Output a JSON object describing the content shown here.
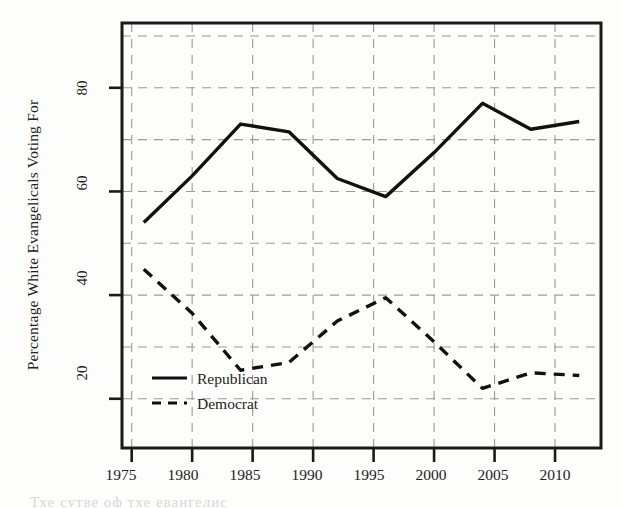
{
  "figure": {
    "background_color": "#fdfdfc",
    "axis_color": "#1a1a1a",
    "grid_color": "#9a9a9a",
    "series_colors": {
      "republican": "#111111",
      "democrat": "#111111"
    },
    "bottom_artifact_text": "Тхе сутве оф тхе евангелис"
  },
  "chart_data": {
    "type": "line",
    "title": "",
    "xlabel": "",
    "ylabel": "Percentage White Evangelicals Voting For",
    "xlim": [
      1974.2,
      2013.8
    ],
    "ylim": [
      10.5,
      92.5
    ],
    "xticks": [
      1975,
      1980,
      1985,
      1990,
      1995,
      2000,
      2005,
      2010
    ],
    "xtick_labels": [
      "1975",
      "1980",
      "1985",
      "1990",
      "1995",
      "2000",
      "2005",
      "2010"
    ],
    "yticks": [
      20,
      40,
      60,
      80
    ],
    "ytick_labels": [
      "20",
      "40",
      "60",
      "80"
    ],
    "y_gridlines": [
      20,
      30,
      40,
      50,
      60,
      70,
      80,
      90
    ],
    "x_gridlines": [
      1975,
      1980,
      1985,
      1990,
      1995,
      2000,
      2005,
      2010
    ],
    "grid": true,
    "legend_position": "lower left",
    "x": [
      1976,
      1980,
      1984,
      1988,
      1992,
      1996,
      2000,
      2004,
      2008,
      2012
    ],
    "series": [
      {
        "name": "Republican",
        "style": "solid",
        "values": [
          54,
          63,
          73,
          71.5,
          62.5,
          59,
          67.5,
          77,
          72,
          73.5
        ]
      },
      {
        "name": "Democrat",
        "style": "dashed",
        "values": [
          45,
          36.5,
          25.5,
          27,
          35,
          39.5,
          31,
          22,
          25,
          24.5
        ]
      }
    ]
  },
  "legend": {
    "items": [
      {
        "label": "Republican",
        "style": "solid"
      },
      {
        "label": "Democrat",
        "style": "dashed"
      }
    ]
  }
}
